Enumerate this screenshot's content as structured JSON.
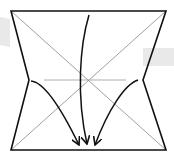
{
  "diagram": {
    "type": "origami-fold-diagram",
    "colors": {
      "outline": "#111111",
      "crease": "#777777",
      "center_crease": "#999999",
      "arrow": "#111111",
      "watermark": "#e9e9e9",
      "background": "#ffffff"
    },
    "shape": {
      "top_left": [
        11,
        11
      ],
      "top_right": [
        166,
        11
      ],
      "bottom_left": [
        11,
        150
      ],
      "bottom_right": [
        166,
        150
      ],
      "left_notch": [
        29,
        80
      ],
      "right_notch": [
        143,
        80
      ]
    },
    "creases": [
      {
        "name": "diagonal-1",
        "from": [
          11,
          11
        ],
        "to": [
          166,
          150
        ]
      },
      {
        "name": "diagonal-2",
        "from": [
          166,
          11
        ],
        "to": [
          11,
          150
        ]
      },
      {
        "name": "horizontal-center",
        "from": [
          44,
          80
        ],
        "to": [
          126,
          80
        ]
      }
    ],
    "arrows": [
      {
        "name": "left-arrow",
        "direction": "down-right"
      },
      {
        "name": "center-arrow",
        "direction": "down"
      },
      {
        "name": "right-arrow",
        "direction": "down-left"
      }
    ]
  }
}
